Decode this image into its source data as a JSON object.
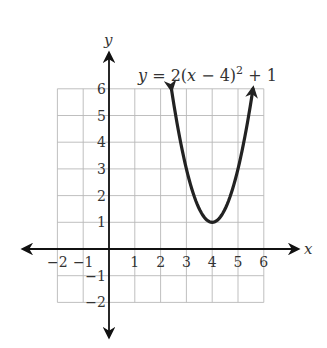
{
  "chart_data": {
    "type": "line",
    "title": "",
    "equation": "y = 2(x − 4)² + 1",
    "equation_parts": {
      "lhs": "y",
      "eq": " = 2(",
      "x": "x",
      "rest": " − 4)",
      "exp": "2",
      "tail": " + 1"
    },
    "function": {
      "a": 2,
      "h": 4,
      "k": 1
    },
    "vertex": [
      4,
      1
    ],
    "xlabel": "x",
    "ylabel": "y",
    "xlim": [
      -2,
      6
    ],
    "ylim": [
      -2,
      6
    ],
    "grid": true,
    "x_ticks": [
      -2,
      -1,
      1,
      2,
      3,
      4,
      5,
      6
    ],
    "y_ticks": [
      -2,
      -1,
      1,
      2,
      3,
      4,
      5,
      6
    ],
    "x_tick_labels": [
      "−2",
      "−1",
      "1",
      "2",
      "3",
      "4",
      "5",
      "6"
    ],
    "y_tick_labels": [
      "−2",
      "−1",
      "1",
      "2",
      "3",
      "4",
      "5",
      "6"
    ],
    "curve_domain": [
      2.42,
      5.58
    ],
    "series": [
      {
        "name": "y = 2(x − 4)² + 1",
        "x": [
          2.42,
          3,
          3.5,
          4,
          4.5,
          5,
          5.58
        ],
        "y": [
          6,
          3,
          1.5,
          1,
          1.5,
          3,
          6
        ]
      }
    ],
    "colors": {
      "curve": "#222222",
      "axis": "#111111",
      "grid": "#b8b8b8"
    }
  }
}
